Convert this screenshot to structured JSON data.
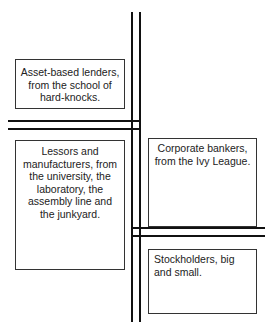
{
  "diagram": {
    "boxes": [
      {
        "id": "top-left",
        "text": "Asset-based lenders, from the school of hard-knocks."
      },
      {
        "id": "bottom-left",
        "text": "Lessors and manufacturers, from the university, the laboratory, the assembly line and the junkyard."
      },
      {
        "id": "top-right",
        "text": "Corporate bankers, from the Ivy League."
      },
      {
        "id": "bottom-right",
        "text": "Stockholders, big and small."
      }
    ],
    "line_color": "#111111"
  }
}
